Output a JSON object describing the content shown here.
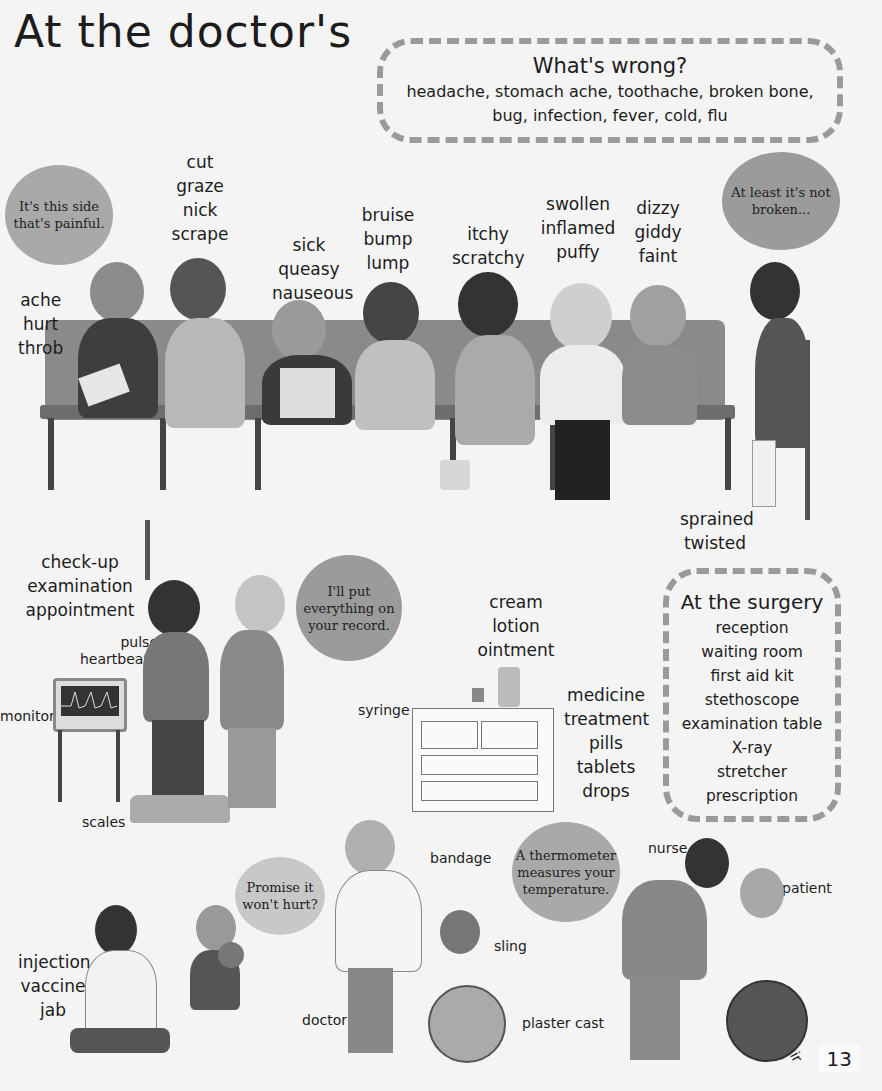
{
  "page": {
    "title": "At the doctor's",
    "page_number": "13"
  },
  "whats_wrong": {
    "title": "What's wrong?",
    "line1": "headache, stomach ache, toothache, broken bone,",
    "line2": "bug, infection, fever, cold, flu"
  },
  "bench_words": {
    "ache": [
      "ache",
      "hurt",
      "throb"
    ],
    "cut": [
      "cut",
      "graze",
      "nick",
      "scrape"
    ],
    "sick": [
      "sick",
      "queasy",
      "nauseous"
    ],
    "bruise": [
      "bruise",
      "bump",
      "lump"
    ],
    "itchy": [
      "itchy",
      "scratchy"
    ],
    "swollen": [
      "swollen",
      "inflamed",
      "puffy"
    ],
    "dizzy": [
      "dizzy",
      "giddy",
      "faint"
    ],
    "sprained": [
      "sprained",
      "twisted"
    ]
  },
  "bubbles": {
    "painful": "It's this side that's painful.",
    "not_broken": "At least it's not broken...",
    "record": "I'll put everything on your record.",
    "promise": "Promise it won't hurt?",
    "thermometer": "A thermometer measures your temperature."
  },
  "checkup_words": [
    "check-up",
    "examination",
    "appointment"
  ],
  "cream_words": [
    "cream",
    "lotion",
    "ointment"
  ],
  "medicine_words": [
    "medicine",
    "treatment",
    "pills",
    "tablets",
    "drops"
  ],
  "injection_words": [
    "injection",
    "vaccine",
    "jab"
  ],
  "labels": {
    "pulse": "pulse",
    "heartbeat": "heartbeat",
    "monitor": "monitor",
    "syringe": "syringe",
    "scales": "scales",
    "doctor": "doctor",
    "bandage": "bandage",
    "sling": "sling",
    "plaster_cast": "plaster cast",
    "nurse": "nurse",
    "patient": "patient",
    "wheelchair": "wheelchair"
  },
  "surgery": {
    "title": "At the surgery",
    "items": [
      "reception",
      "waiting room",
      "first aid kit",
      "stethoscope",
      "examination table",
      "X-ray",
      "stretcher",
      "prescription"
    ]
  },
  "colors": {
    "background": "#f4f4f4",
    "dash_border": "#9a9a9a",
    "bubble": "#a9a9a9",
    "bench": "#8a8a8a"
  }
}
